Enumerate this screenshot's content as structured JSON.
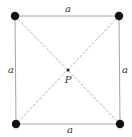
{
  "diagram": {
    "type": "square-with-diagonals",
    "colors": {
      "side": "#9a9a9a",
      "diagonal": "#a8a8a8",
      "vertex": "#111111",
      "center": "#222222",
      "text": "#333333"
    },
    "vertices": [
      {
        "name": "top-left",
        "x": 15,
        "y": 16
      },
      {
        "name": "top-right",
        "x": 119,
        "y": 16
      },
      {
        "name": "bottom-right",
        "x": 120,
        "y": 124
      },
      {
        "name": "bottom-left",
        "x": 16,
        "y": 124
      }
    ],
    "center": {
      "label": "P",
      "x": 68,
      "y": 70
    },
    "labels": {
      "top": "a",
      "bottom": "a",
      "left": "a",
      "right": "a",
      "center": "P"
    }
  }
}
